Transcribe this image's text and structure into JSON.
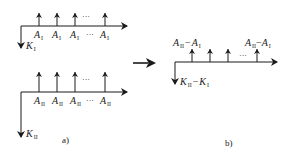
{
  "colors": {
    "stroke": "#1a1a1a",
    "background": "#ffffff"
  },
  "panel_a": {
    "caption": "a)",
    "top": {
      "arrow_labels": [
        {
          "main": "A",
          "sub": "I"
        },
        {
          "main": "A",
          "sub": "I"
        },
        {
          "main": "A",
          "sub": "I"
        },
        {
          "main": "A",
          "sub": "I"
        }
      ],
      "ellipsis": "···",
      "down_label": {
        "main": "K",
        "sub": "I"
      }
    },
    "bottom": {
      "arrow_labels": [
        {
          "main": "A",
          "sub": "II"
        },
        {
          "main": "A",
          "sub": "II"
        },
        {
          "main": "A",
          "sub": "II"
        },
        {
          "main": "A",
          "sub": "II"
        }
      ],
      "ellipsis": "···",
      "down_label": {
        "main": "K",
        "sub": "II"
      }
    }
  },
  "transition_arrow": "right-arrow",
  "panel_b": {
    "caption": "b)",
    "first_label": {
      "a": "A",
      "a_sub": "II",
      "op": "−",
      "b": "A",
      "b_sub": "I"
    },
    "last_label": {
      "a": "A",
      "a_sub": "II",
      "op": "−",
      "b": "A",
      "b_sub": "I"
    },
    "ellipsis": "···",
    "down_label": {
      "a": "K",
      "a_sub": "II",
      "op": "−",
      "b": "K",
      "b_sub": "I"
    }
  }
}
